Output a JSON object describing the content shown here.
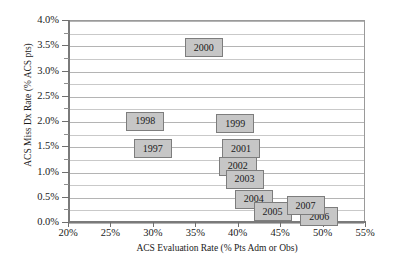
{
  "chart_data": {
    "type": "scatter",
    "title": "",
    "xlabel": "ACS Evaluation Rate (% Pts Adm or Obs)",
    "ylabel": "ACS Miss Dx Rate (% ACS pts)",
    "xlim": [
      20,
      55
    ],
    "ylim": [
      0.0,
      4.0
    ],
    "xticks": [
      20,
      25,
      30,
      35,
      40,
      45,
      50,
      55
    ],
    "xtick_labels": [
      "20%",
      "25%",
      "30%",
      "35%",
      "40%",
      "45%",
      "50%",
      "55%"
    ],
    "yticks": [
      0.0,
      0.5,
      1.0,
      1.5,
      2.0,
      2.5,
      3.0,
      3.5,
      4.0
    ],
    "ytick_labels": [
      "0.0%",
      "0.5%",
      "1.0%",
      "1.5%",
      "2.0%",
      "2.5%",
      "3.0%",
      "3.5%",
      "4.0%"
    ],
    "grid": true,
    "grid_axis": "y",
    "grid_minor_step": 0.25,
    "legend": "none",
    "marker_style": "labeled-box",
    "marker_fill": "#c6c6c6",
    "marker_border": "#7d7d7d",
    "points": [
      {
        "label": "1997",
        "x": 30.0,
        "y": 1.45
      },
      {
        "label": "1998",
        "x": 29.1,
        "y": 2.0
      },
      {
        "label": "1999",
        "x": 39.7,
        "y": 1.95
      },
      {
        "label": "2000",
        "x": 36.0,
        "y": 3.45
      },
      {
        "label": "2001",
        "x": 40.4,
        "y": 1.45
      },
      {
        "label": "2002",
        "x": 40.0,
        "y": 1.1
      },
      {
        "label": "2003",
        "x": 40.8,
        "y": 0.85
      },
      {
        "label": "2004",
        "x": 41.9,
        "y": 0.45
      },
      {
        "label": "2005",
        "x": 44.1,
        "y": 0.2
      },
      {
        "label": "2006",
        "x": 49.6,
        "y": 0.1
      },
      {
        "label": "2007",
        "x": 48.0,
        "y": 0.32
      }
    ]
  }
}
